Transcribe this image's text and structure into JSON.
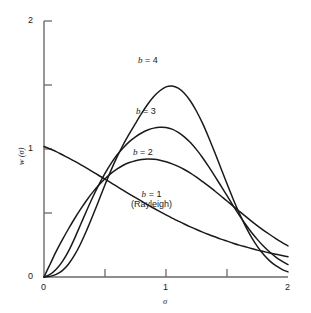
{
  "chart_data": {
    "type": "line",
    "title": "",
    "subtitle": "",
    "xlabel": "σ",
    "ylabel": "w (σ)",
    "xlim": [
      0,
      2
    ],
    "ylim": [
      0,
      2
    ],
    "xticks": [
      0,
      0.5,
      1,
      1.5,
      2
    ],
    "xtick_labels": [
      "0",
      "",
      "1",
      "",
      "2"
    ],
    "yticks": [
      0,
      0.5,
      1,
      1.5,
      2
    ],
    "ytick_labels": [
      "0",
      "",
      "1",
      "",
      "2"
    ],
    "grid": false,
    "legend_position": "inline-annotations",
    "line_color": "#1a1a1a",
    "axis_color": "#555555",
    "background_color": "#ffffff",
    "x": [
      0,
      0.05,
      0.1,
      0.15,
      0.2,
      0.25,
      0.3,
      0.35,
      0.4,
      0.45,
      0.5,
      0.55,
      0.6,
      0.65,
      0.7,
      0.75,
      0.8,
      0.85,
      0.9,
      0.95,
      1.0,
      1.05,
      1.1,
      1.15,
      1.2,
      1.25,
      1.3,
      1.35,
      1.4,
      1.45,
      1.5,
      1.55,
      1.6,
      1.65,
      1.7,
      1.75,
      1.8,
      1.85,
      1.9,
      1.95,
      2.0
    ],
    "series": [
      {
        "name": "b = 1",
        "label": "b = 1",
        "note": "(Rayleigh)",
        "peak_x": 0.0,
        "peak_y": 1.02,
        "values": [
          1.02,
          1.0,
          0.98,
          0.955,
          0.93,
          0.905,
          0.878,
          0.85,
          0.822,
          0.793,
          0.765,
          0.735,
          0.706,
          0.677,
          0.648,
          0.62,
          0.592,
          0.564,
          0.537,
          0.511,
          0.485,
          0.46,
          0.437,
          0.414,
          0.392,
          0.371,
          0.351,
          0.332,
          0.314,
          0.296,
          0.28,
          0.264,
          0.249,
          0.236,
          0.223,
          0.21,
          0.199,
          0.188,
          0.178,
          0.168,
          0.159
        ]
      },
      {
        "name": "b = 2",
        "label": "b = 2",
        "peak_x": 0.72,
        "peak_y": 0.92,
        "values": [
          0.0,
          0.1,
          0.2,
          0.29,
          0.375,
          0.455,
          0.53,
          0.6,
          0.663,
          0.718,
          0.768,
          0.81,
          0.845,
          0.873,
          0.894,
          0.909,
          0.918,
          0.921,
          0.919,
          0.912,
          0.9,
          0.884,
          0.864,
          0.84,
          0.812,
          0.78,
          0.745,
          0.71,
          0.672,
          0.633,
          0.594,
          0.554,
          0.514,
          0.475,
          0.437,
          0.4,
          0.365,
          0.332,
          0.3,
          0.27,
          0.243
        ]
      },
      {
        "name": "b = 3",
        "label": "b = 3",
        "peak_x": 0.85,
        "peak_y": 1.17,
        "values": [
          0.0,
          0.02,
          0.06,
          0.12,
          0.2,
          0.3,
          0.41,
          0.52,
          0.625,
          0.722,
          0.81,
          0.888,
          0.955,
          1.01,
          1.058,
          1.095,
          1.125,
          1.148,
          1.163,
          1.17,
          1.168,
          1.155,
          1.13,
          1.095,
          1.05,
          0.995,
          0.932,
          0.862,
          0.788,
          0.712,
          0.635,
          0.558,
          0.484,
          0.414,
          0.35,
          0.292,
          0.24,
          0.195,
          0.156,
          0.124,
          0.097
        ]
      },
      {
        "name": "b = 4",
        "label": "b = 4",
        "peak_x": 0.92,
        "peak_y": 1.49,
        "values": [
          0.0,
          0.005,
          0.02,
          0.05,
          0.1,
          0.17,
          0.26,
          0.365,
          0.48,
          0.6,
          0.72,
          0.835,
          0.94,
          1.035,
          1.12,
          1.2,
          1.278,
          1.35,
          1.41,
          1.455,
          1.485,
          1.492,
          1.475,
          1.435,
          1.375,
          1.295,
          1.2,
          1.09,
          0.972,
          0.85,
          0.728,
          0.61,
          0.5,
          0.4,
          0.312,
          0.237,
          0.175,
          0.126,
          0.088,
          0.06,
          0.04
        ]
      }
    ],
    "annotations": [
      {
        "text": "b = 4",
        "x": 0.9,
        "y": 1.72
      },
      {
        "text": "b = 3",
        "x": 0.88,
        "y": 1.32
      },
      {
        "text": "b = 2",
        "x": 0.86,
        "y": 1.0
      },
      {
        "text": "b = 1",
        "x": 0.84,
        "y": 0.67
      },
      {
        "text": "(Rayleigh)",
        "x": 0.84,
        "y": 0.56
      }
    ]
  },
  "axes": {
    "x_tick_0": "0",
    "x_tick_1": "1",
    "x_tick_2": "2",
    "y_tick_0": "0",
    "y_tick_1": "1",
    "y_tick_2": "2",
    "x_axis_title": "σ",
    "y_axis_title": "w (σ)"
  },
  "labels": {
    "b4": "b",
    "b4_eq": "= 4",
    "b3": "b",
    "b3_eq": "= 3",
    "b2": "b",
    "b2_eq": "= 2",
    "b1": "b",
    "b1_eq": "= 1",
    "rayleigh": "(Rayleigh)"
  }
}
